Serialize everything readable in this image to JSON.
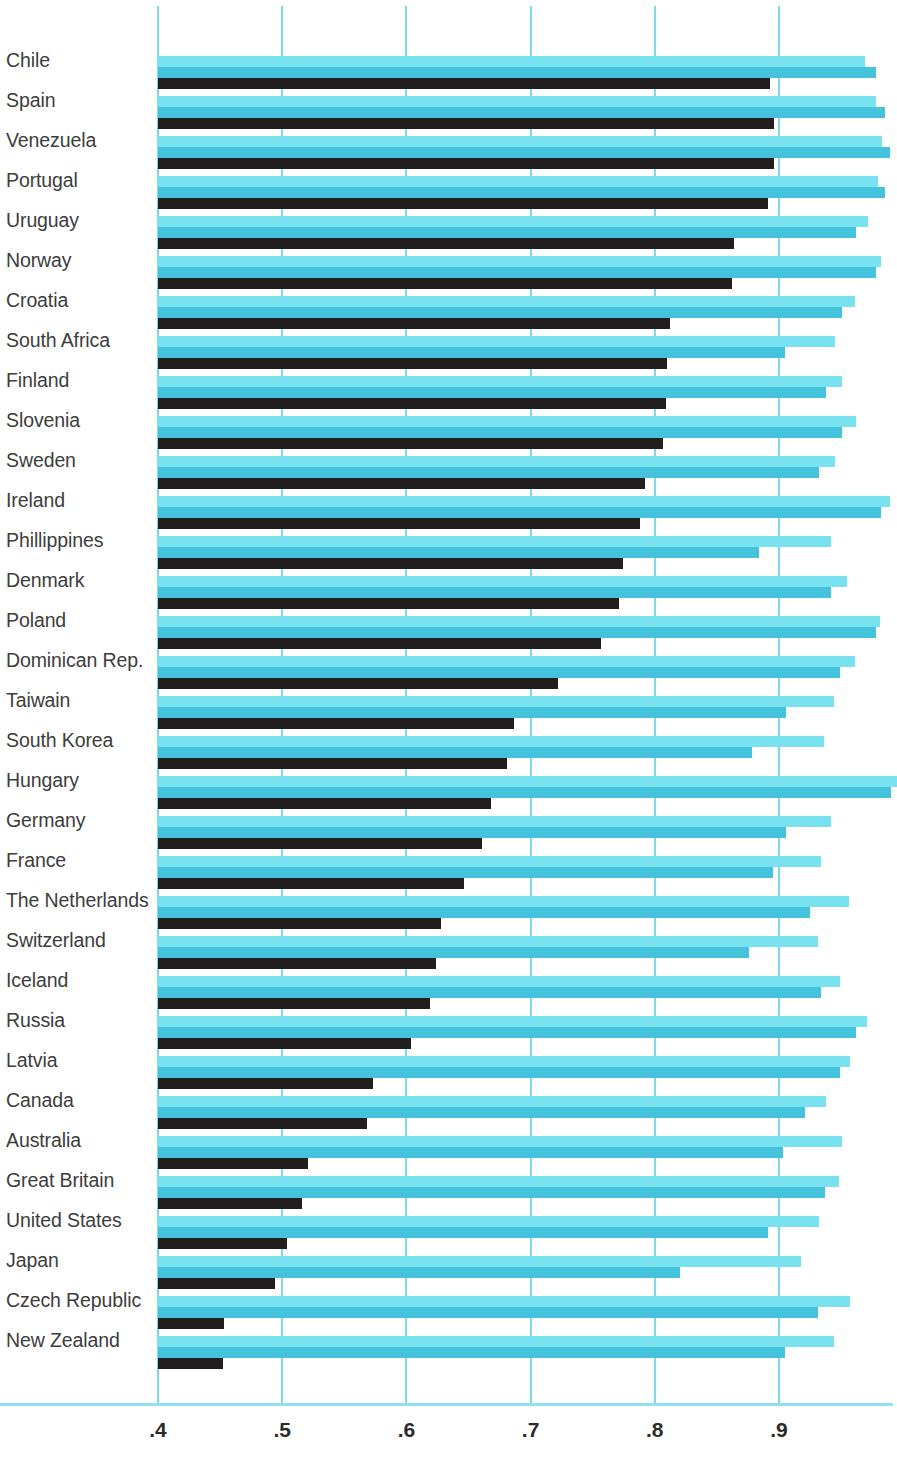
{
  "chart_data": {
    "type": "bar",
    "orientation": "horizontal",
    "title": "",
    "subtitle": "",
    "xlabel": "",
    "ylabel": "",
    "xlim": [
      0.4,
      0.96
    ],
    "xticks": [
      ".4",
      ".5",
      ".6",
      ".7",
      ".8",
      ".9"
    ],
    "xtick_values": [
      0.4,
      0.5,
      0.6,
      0.7,
      0.8,
      0.9
    ],
    "grid": "vertical",
    "legend": "none",
    "colors": {
      "series_light": "#79e2f0",
      "series_mid": "#46c3dc",
      "series_dark": "#221d1f",
      "gridline": "#7fd9ea",
      "axis_line": "#8fe1f0",
      "label_text": "#3d3d3d",
      "tick_text": "#2b2b2b",
      "background": "#ffffff"
    },
    "categories": [
      "Chile",
      "Spain",
      "Venezuela",
      "Portugal",
      "Uruguay",
      "Norway",
      "Croatia",
      "South Africa",
      "Finland",
      "Slovenia",
      "Sweden",
      "Ireland",
      "Phillippines",
      "Denmark",
      "Poland",
      "Dominican Rep.",
      "Taiwain",
      "South Korea",
      "Hungary",
      "Germany",
      "France",
      "The Netherlands",
      "Switzerland",
      "Iceland",
      "Russia",
      "Latvia",
      "Canada",
      "Australia",
      "Great Britain",
      "United States",
      "Japan",
      "Czech Republic",
      "New Zealand"
    ],
    "series": [
      {
        "name": "series-light",
        "color": "#79e2f0",
        "values": [
          0.969,
          0.978,
          0.983,
          0.98,
          0.972,
          0.982,
          0.961,
          0.945,
          0.951,
          0.962,
          0.945,
          0.989,
          0.942,
          0.955,
          0.981,
          0.961,
          0.944,
          0.936,
          0.995,
          0.942,
          0.934,
          0.956,
          0.931,
          0.949,
          0.971,
          0.957,
          0.938,
          0.951,
          0.948,
          0.932,
          0.918,
          0.957,
          0.944
        ]
      },
      {
        "name": "series-mid",
        "color": "#46c3dc",
        "values": [
          0.978,
          0.985,
          0.989,
          0.985,
          0.962,
          0.978,
          0.951,
          0.905,
          0.938,
          0.951,
          0.932,
          0.982,
          0.884,
          0.942,
          0.978,
          0.949,
          0.906,
          0.878,
          0.99,
          0.906,
          0.895,
          0.925,
          0.876,
          0.934,
          0.962,
          0.949,
          0.921,
          0.903,
          0.937,
          0.891,
          0.82,
          0.931,
          0.905
        ]
      },
      {
        "name": "series-dark",
        "color": "#221d1f",
        "values": [
          0.893,
          0.896,
          0.896,
          0.891,
          0.864,
          0.862,
          0.812,
          0.81,
          0.809,
          0.807,
          0.792,
          0.788,
          0.774,
          0.771,
          0.757,
          0.722,
          0.687,
          0.681,
          0.668,
          0.661,
          0.646,
          0.628,
          0.624,
          0.619,
          0.604,
          0.573,
          0.568,
          0.521,
          0.516,
          0.504,
          0.494,
          0.453,
          0.452
        ]
      }
    ]
  }
}
